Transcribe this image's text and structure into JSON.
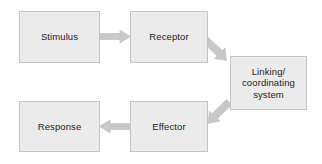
{
  "diagram": {
    "background_color": "#ffffff",
    "box_fill_color": "#ebebeb",
    "box_border_color": "#c4c4c4",
    "arrow_color": "#c8c8c8",
    "arrow_edge_color": "#b0b0b0",
    "text_color": "#1c1c1c",
    "nodes": [
      {
        "id": "stimulus",
        "label": "Stimulus"
      },
      {
        "id": "receptor",
        "label": "Receptor"
      },
      {
        "id": "linking",
        "label": "Linking/\ncoordinating\nsystem",
        "line1": "Linking/",
        "line2": "coordinating",
        "line3": "system"
      },
      {
        "id": "effector",
        "label": "Effector"
      },
      {
        "id": "response",
        "label": "Response"
      }
    ],
    "arrows": [
      {
        "id": "stimulus-to-receptor",
        "from": "stimulus",
        "to": "receptor",
        "direction": "right"
      },
      {
        "id": "receptor-to-linking",
        "from": "receptor",
        "to": "linking",
        "direction": "down-right"
      },
      {
        "id": "linking-to-effector",
        "from": "linking",
        "to": "effector",
        "direction": "down-left"
      },
      {
        "id": "effector-to-response",
        "from": "effector",
        "to": "response",
        "direction": "left"
      }
    ]
  }
}
